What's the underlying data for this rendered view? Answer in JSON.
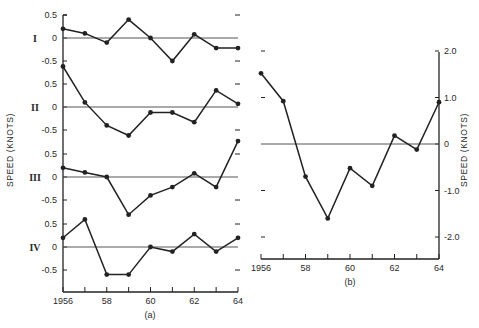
{
  "chart_data": [
    {
      "id": "a",
      "type": "line",
      "caption": "(a)",
      "ylabel": "SPEED (KNOTS)",
      "xlabel": "",
      "x": [
        1956,
        1957,
        1958,
        1959,
        1960,
        1961,
        1962,
        1963,
        1964
      ],
      "x_tick_labels": [
        "1956",
        "",
        "58",
        "",
        "60",
        "",
        "62",
        "",
        "64"
      ],
      "xlim": [
        1956,
        1964
      ],
      "grid": false,
      "series": [
        {
          "name": "I",
          "ylim": [
            -0.5,
            0.5
          ],
          "y_tick_labels": [
            "0.5",
            "0",
            "-0.5"
          ],
          "values": [
            0.2,
            0.1,
            -0.1,
            0.4,
            0.0,
            -0.5,
            0.08,
            -0.22,
            -0.22
          ]
        },
        {
          "name": "II",
          "ylim": [
            -0.5,
            0.5
          ],
          "y_tick_labels": [
            "0.5",
            "0",
            "-0.5"
          ],
          "values": [
            0.88,
            0.1,
            -0.4,
            -0.62,
            -0.12,
            -0.12,
            -0.33,
            0.36,
            0.07
          ]
        },
        {
          "name": "III",
          "ylim": [
            -0.5,
            0.5
          ],
          "y_tick_labels": [
            "0.5",
            "0",
            "-0.5"
          ],
          "values": [
            0.2,
            0.1,
            0.0,
            -0.82,
            -0.4,
            -0.22,
            0.08,
            -0.22,
            0.78
          ]
        },
        {
          "name": "IV",
          "ylim": [
            -0.5,
            0.5
          ],
          "y_tick_labels": [
            "0.5",
            "0",
            "-0.5"
          ],
          "values": [
            0.2,
            0.6,
            -0.6,
            -0.6,
            0.0,
            -0.1,
            0.28,
            -0.1,
            0.2
          ]
        }
      ]
    },
    {
      "id": "b",
      "type": "line",
      "caption": "(b)",
      "ylabel": "SPEED (KNOTS)",
      "xlabel": "",
      "x": [
        1956,
        1957,
        1958,
        1959,
        1960,
        1961,
        1962,
        1963,
        1964
      ],
      "x_tick_labels": [
        "1956",
        "",
        "58",
        "",
        "60",
        "",
        "62",
        "",
        "64"
      ],
      "xlim": [
        1956,
        1964
      ],
      "ylim": [
        -2.5,
        2.0
      ],
      "y_ticks": [
        2.0,
        1.0,
        0,
        -1.0,
        -2.0
      ],
      "y_tick_labels": [
        "2.0",
        "1.0",
        "0",
        "-1.0",
        "-2.0"
      ],
      "y_axis_position": "right",
      "grid": false,
      "series": [
        {
          "name": "speed",
          "values": [
            1.52,
            0.92,
            -0.7,
            -1.6,
            -0.52,
            -0.9,
            0.18,
            -0.12,
            0.9
          ]
        }
      ]
    }
  ],
  "colors": {
    "ink": "#222222",
    "zero_line": "#555555",
    "background": "#ffffff"
  }
}
